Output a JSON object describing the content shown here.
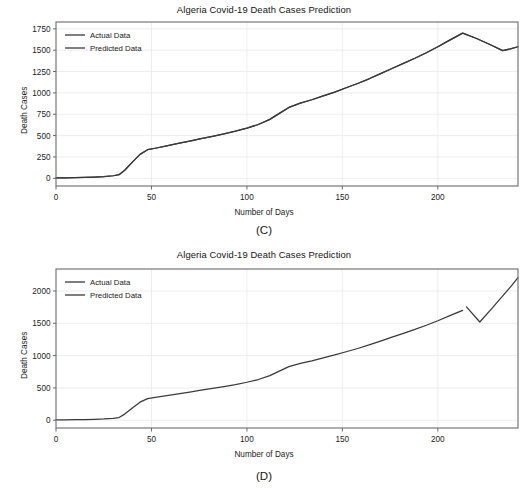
{
  "figure": {
    "panels": [
      {
        "id": "C",
        "caption": "(C)",
        "chart_data": {
          "type": "line",
          "title": "Algeria Covid-19 Death Cases Prediction",
          "xlabel": "Number of Days",
          "ylabel": "Death Cases",
          "xlim": [
            0,
            242
          ],
          "ylim": [
            -90,
            1830
          ],
          "xticks": [
            0,
            50,
            100,
            150,
            200
          ],
          "xtick_labels": [
            "0",
            "50",
            "100",
            "150",
            "200"
          ],
          "yticks": [
            0,
            250,
            500,
            750,
            1000,
            1250,
            1500,
            1750
          ],
          "ytick_labels": [
            "0",
            "250",
            "500",
            "750",
            "1000",
            "1250",
            "1500",
            "1750"
          ],
          "grid": true,
          "legend_position": "upper left",
          "legend": [
            "Actual Data",
            "Predicted Data"
          ],
          "series": [
            {
              "name": "Actual Data",
              "color": "#3a3a3a",
              "x": [
                0,
                5,
                10,
                15,
                20,
                25,
                30,
                33,
                36,
                40,
                44,
                48,
                52,
                58,
                64,
                70,
                76,
                82,
                88,
                94,
                100,
                106,
                112,
                117,
                122,
                128,
                134,
                140,
                146,
                152,
                158,
                164,
                170,
                176,
                182,
                188,
                194,
                200,
                206,
                213,
                220,
                227,
                234,
                238,
                242
              ],
              "y": [
                5,
                6,
                8,
                10,
                14,
                20,
                30,
                42,
                95,
                190,
                280,
                335,
                352,
                380,
                408,
                436,
                465,
                492,
                520,
                552,
                588,
                630,
                690,
                760,
                830,
                880,
                920,
                965,
                1010,
                1060,
                1110,
                1165,
                1225,
                1285,
                1345,
                1405,
                1470,
                1540,
                1615,
                1700,
                1640,
                1570,
                1495,
                1515,
                1540
              ]
            },
            {
              "name": "Predicted Data",
              "color": "#3a3a3a",
              "x": [
                0,
                5,
                10,
                15,
                20,
                25,
                30,
                33,
                36,
                40,
                44,
                48,
                52,
                58,
                64,
                70,
                76,
                82,
                88,
                94,
                100,
                106,
                112,
                117,
                122,
                128,
                134,
                140,
                146,
                152,
                158,
                164,
                170,
                176,
                182,
                188,
                194,
                200,
                206,
                213,
                220,
                227,
                234,
                238,
                242
              ],
              "y": [
                5,
                6,
                8,
                10,
                14,
                20,
                30,
                42,
                95,
                190,
                280,
                335,
                352,
                380,
                408,
                436,
                465,
                492,
                520,
                552,
                588,
                630,
                690,
                760,
                830,
                880,
                920,
                965,
                1010,
                1060,
                1110,
                1165,
                1225,
                1285,
                1345,
                1405,
                1470,
                1540,
                1615,
                1700,
                1640,
                1570,
                1495,
                1515,
                1540
              ]
            }
          ]
        }
      },
      {
        "id": "D",
        "caption": "(D)",
        "chart_data": {
          "type": "line",
          "title": "Algeria Covid-19 Death Cases Prediction",
          "xlabel": "Number of Days",
          "ylabel": "Death Cases",
          "xlim": [
            0,
            242
          ],
          "ylim": [
            -120,
            2340
          ],
          "xticks": [
            0,
            50,
            100,
            150,
            200
          ],
          "xtick_labels": [
            "0",
            "50",
            "100",
            "150",
            "200"
          ],
          "yticks": [
            0,
            500,
            1000,
            1500,
            2000
          ],
          "ytick_labels": [
            "0",
            "500",
            "1000",
            "1500",
            "2000"
          ],
          "grid": true,
          "legend_position": "upper left",
          "legend": [
            "Actual Data",
            "Predicted Data"
          ],
          "series": [
            {
              "name": "Actual Data",
              "color": "#3a3a3a",
              "x": [
                0,
                5,
                10,
                15,
                20,
                25,
                30,
                33,
                36,
                40,
                44,
                48,
                52,
                58,
                64,
                70,
                76,
                82,
                88,
                94,
                100,
                106,
                112,
                117,
                122,
                128,
                134,
                140,
                146,
                152,
                158,
                164,
                170,
                176,
                182,
                188,
                194,
                200,
                206,
                213
              ],
              "y": [
                5,
                6,
                8,
                10,
                14,
                20,
                30,
                42,
                95,
                190,
                280,
                335,
                352,
                380,
                408,
                436,
                465,
                492,
                520,
                552,
                588,
                630,
                690,
                760,
                830,
                880,
                920,
                965,
                1010,
                1060,
                1110,
                1165,
                1225,
                1285,
                1345,
                1405,
                1470,
                1540,
                1615,
                1700
              ]
            },
            {
              "name": "Predicted Data",
              "color": "#3a3a3a",
              "x": [
                215,
                222,
                228,
                234,
                238,
                242
              ],
              "y": [
                1755,
                1520,
                1720,
                1925,
                2060,
                2205
              ]
            }
          ]
        }
      }
    ]
  }
}
